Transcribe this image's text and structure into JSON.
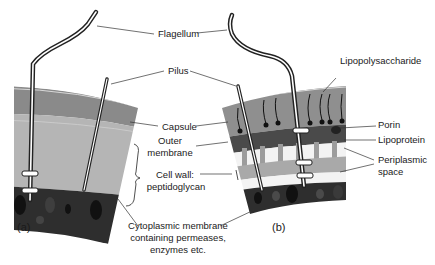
{
  "figure": {
    "panels": [
      {
        "id": "a",
        "label": "(a)",
        "type": "gram-positive-cell-envelope"
      },
      {
        "id": "b",
        "label": "(b)",
        "type": "gram-negative-cell-envelope"
      }
    ],
    "labels": {
      "flagellum": "Flagellum",
      "pilus": "Pilus",
      "capsule": "Capsule",
      "outer_membrane_1": "Outer",
      "outer_membrane_2": "membrane",
      "cell_wall_1": "Cell wall:",
      "cell_wall_2": "peptidoglycan",
      "cytoplasmic_1": "Cytoplasmic membrane",
      "cytoplasmic_2": "containing permeases,",
      "cytoplasmic_3": "enzymes etc.",
      "lipopolysaccharide": "Lipopolysaccharide",
      "porin": "Porin",
      "lipoprotein": "Lipoprotein",
      "periplasmic_1": "Periplasmic",
      "periplasmic_2": "space"
    },
    "colors": {
      "capsule": "#8a8a8a",
      "cell_wall_a": "#b3b3b3",
      "outer_membrane": "#4a4a4a",
      "periplasm": "#f2f2f2",
      "peptidoglycan_b": "#a8a8a8",
      "cytoplasmic_membrane": "#2b2b2b",
      "lipoprotein": "#9a9a9a"
    }
  }
}
